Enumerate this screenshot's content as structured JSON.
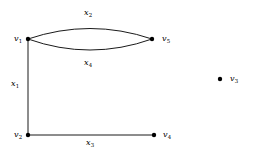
{
  "figure": {
    "type": "undirected-multigraph",
    "background_color": "#ffffff",
    "stroke_color": "#000000",
    "width": 257,
    "height": 153
  },
  "vertices": [
    {
      "id": "v1",
      "name": "v",
      "index": "1",
      "x": 28,
      "y": 39,
      "label_x": 14,
      "label_y": 35,
      "label_side": "left"
    },
    {
      "id": "v2",
      "name": "v",
      "index": "2",
      "x": 28,
      "y": 135,
      "label_x": 14,
      "label_y": 131,
      "label_side": "left"
    },
    {
      "id": "v3",
      "name": "v",
      "index": "3",
      "x": 220,
      "y": 79,
      "label_x": 230,
      "label_y": 75,
      "label_side": "right"
    },
    {
      "id": "v4",
      "name": "v",
      "index": "4",
      "x": 154,
      "y": 135,
      "label_x": 163,
      "label_y": 131,
      "label_side": "right"
    },
    {
      "id": "v5",
      "name": "v",
      "index": "5",
      "x": 152,
      "y": 39,
      "label_x": 162,
      "label_y": 35,
      "label_side": "right"
    }
  ],
  "edges": [
    {
      "id": "x1",
      "name": "x",
      "index": "1",
      "from": "v1",
      "to": "v2",
      "shape": "straight",
      "label_x": 11,
      "label_y": 80
    },
    {
      "id": "x2",
      "name": "x",
      "index": "2",
      "from": "v1",
      "to": "v5",
      "shape": "arc-up",
      "label_x": 84,
      "label_y": 9
    },
    {
      "id": "x3",
      "name": "x",
      "index": "3",
      "from": "v2",
      "to": "v4",
      "shape": "straight",
      "label_x": 86,
      "label_y": 139
    },
    {
      "id": "x4",
      "name": "x",
      "index": "4",
      "from": "v1",
      "to": "v5",
      "shape": "arc-down",
      "label_x": 84,
      "label_y": 59
    }
  ],
  "geometry": {
    "edge_x1_path": "M 28 39 L 28 135",
    "edge_x3_path": "M 28 135 L 154 135",
    "edge_x2_path": "M 28 39 Q 90 18 152 39",
    "edge_x4_path": "M 28 39 Q 90 61 152 39",
    "vertex_dot_radius": 2.2,
    "stroke_width": 0.9
  }
}
